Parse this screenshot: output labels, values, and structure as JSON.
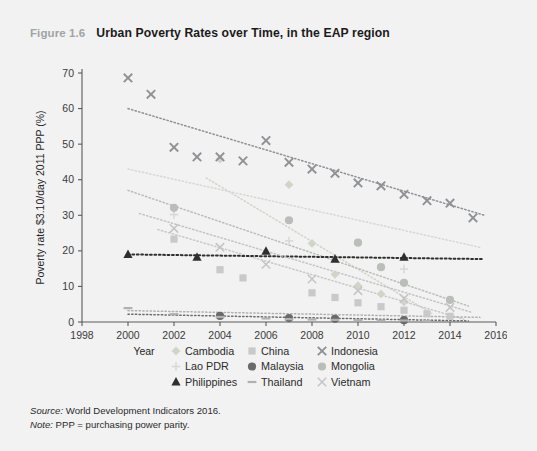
{
  "figure": {
    "number": "Figure 1.6",
    "title": "Urban Poverty Rates over Time, in the EAP region"
  },
  "notes": {
    "source_label": "Source:",
    "source_text": " World Development Indicators 2016.",
    "note_label": "Note:",
    "note_text": " PPP = purchasing power parity."
  },
  "chart_data": {
    "type": "scatter",
    "title": "Urban Poverty Rates over Time, in the EAP region",
    "xlabel": "Year",
    "ylabel": "Poverty rate $3.10/day 2011 PPP (%)",
    "xlim": [
      1998,
      2016
    ],
    "ylim": [
      0,
      70
    ],
    "xticks": [
      1998,
      2000,
      2002,
      2004,
      2006,
      2008,
      2010,
      2012,
      2014,
      2016
    ],
    "yticks": [
      0,
      10,
      20,
      30,
      40,
      50,
      60,
      70
    ],
    "grid": false,
    "legend_position": "bottom",
    "trendlines": true,
    "series": [
      {
        "name": "Cambodia",
        "marker": "diamond",
        "color": "#cfd6c8",
        "points": [
          {
            "x": 2004,
            "y": 45.8
          },
          {
            "x": 2007,
            "y": 38.6
          },
          {
            "x": 2008,
            "y": 22.1
          },
          {
            "x": 2009,
            "y": 13.4
          },
          {
            "x": 2010,
            "y": 10.2
          },
          {
            "x": 2011,
            "y": 7.9
          },
          {
            "x": 2012,
            "y": 5.6
          }
        ],
        "trend": {
          "x1": 2003.4,
          "y1": 40.5,
          "x2": 2013.2,
          "y2": 2.4
        }
      },
      {
        "name": "China",
        "marker": "square",
        "color": "#c9c9c9",
        "points": [
          {
            "x": 2002,
            "y": 23.3
          },
          {
            "x": 2004,
            "y": 14.7
          },
          {
            "x": 2005,
            "y": 12.4
          },
          {
            "x": 2008,
            "y": 8.2
          },
          {
            "x": 2009,
            "y": 6.9
          },
          {
            "x": 2010,
            "y": 5.4
          },
          {
            "x": 2011,
            "y": 4.3
          },
          {
            "x": 2012,
            "y": 3.3
          },
          {
            "x": 2013,
            "y": 2.3
          },
          {
            "x": 2014,
            "y": 1.6
          }
        ],
        "trend": {
          "x1": 2001.3,
          "y1": 26.0,
          "x2": 2014.6,
          "y2": 0.8
        }
      },
      {
        "name": "Indonesia",
        "marker": "x",
        "color": "#8f9196",
        "points": [
          {
            "x": 2000,
            "y": 68.6
          },
          {
            "x": 2001,
            "y": 64.0
          },
          {
            "x": 2002,
            "y": 49.1
          },
          {
            "x": 2003,
            "y": 46.4
          },
          {
            "x": 2004,
            "y": 46.4
          },
          {
            "x": 2005,
            "y": 45.3
          },
          {
            "x": 2006,
            "y": 51.0
          },
          {
            "x": 2007,
            "y": 44.9
          },
          {
            "x": 2008,
            "y": 43.0
          },
          {
            "x": 2009,
            "y": 41.8
          },
          {
            "x": 2010,
            "y": 39.1
          },
          {
            "x": 2011,
            "y": 38.3
          },
          {
            "x": 2012,
            "y": 35.9
          },
          {
            "x": 2013,
            "y": 34.1
          },
          {
            "x": 2014,
            "y": 33.4
          },
          {
            "x": 2015,
            "y": 29.3
          }
        ],
        "trend": {
          "x1": 2000.0,
          "y1": 60.0,
          "x2": 2015.5,
          "y2": 30.0
        }
      },
      {
        "name": "Lao PDR",
        "marker": "plus",
        "color": "#d7d7d7",
        "points": [
          {
            "x": 2002,
            "y": 30.2
          },
          {
            "x": 2007,
            "y": 22.8
          },
          {
            "x": 2012,
            "y": 14.9
          }
        ],
        "trend": {
          "x1": 2000.0,
          "y1": 43.0,
          "x2": 2015.3,
          "y2": 21.0
        }
      },
      {
        "name": "Malaysia",
        "marker": "circle",
        "color": "#6a6a6a",
        "points": [
          {
            "x": 2004,
            "y": 1.7
          },
          {
            "x": 2007,
            "y": 1.1
          },
          {
            "x": 2009,
            "y": 0.9
          },
          {
            "x": 2012,
            "y": 0.5
          }
        ],
        "trend": {
          "x1": 2000.0,
          "y1": 2.2,
          "x2": 2014.8,
          "y2": 0.3
        }
      },
      {
        "name": "Mongolia",
        "marker": "circle-light",
        "color": "#b9bfb8",
        "points": [
          {
            "x": 2002,
            "y": 32.1
          },
          {
            "x": 2007,
            "y": 28.6
          },
          {
            "x": 2010,
            "y": 22.3
          },
          {
            "x": 2011,
            "y": 15.4
          },
          {
            "x": 2012,
            "y": 11.0
          },
          {
            "x": 2014,
            "y": 6.2
          }
        ],
        "trend": {
          "x1": 2000.0,
          "y1": 37.0,
          "x2": 2014.8,
          "y2": 4.5
        }
      },
      {
        "name": "Philippines",
        "marker": "triangle",
        "color": "#2f2f2f",
        "points": [
          {
            "x": 2000,
            "y": 19.0
          },
          {
            "x": 2003,
            "y": 18.2
          },
          {
            "x": 2006,
            "y": 19.9
          },
          {
            "x": 2009,
            "y": 17.7
          },
          {
            "x": 2012,
            "y": 18.2
          }
        ],
        "trend": {
          "x1": 2000.0,
          "y1": 19.0,
          "x2": 2015.4,
          "y2": 17.7
        }
      },
      {
        "name": "Thailand",
        "marker": "line",
        "color": "#b0b0b0",
        "points": [
          {
            "x": 2000,
            "y": 3.9
          },
          {
            "x": 2002,
            "y": 2.2
          },
          {
            "x": 2004,
            "y": 1.4
          },
          {
            "x": 2006,
            "y": 1.0
          },
          {
            "x": 2007,
            "y": 0.8
          },
          {
            "x": 2008,
            "y": 0.7
          },
          {
            "x": 2009,
            "y": 0.6
          },
          {
            "x": 2010,
            "y": 0.5
          },
          {
            "x": 2011,
            "y": 0.4
          },
          {
            "x": 2012,
            "y": 0.4
          },
          {
            "x": 2013,
            "y": 0.3
          }
        ],
        "trend": {
          "x1": 2000.0,
          "y1": 3.2,
          "x2": 2015.3,
          "y2": 1.3
        }
      },
      {
        "name": "Vietnam",
        "marker": "x-light",
        "color": "#c4c4c4",
        "points": [
          {
            "x": 2002,
            "y": 26.3
          },
          {
            "x": 2004,
            "y": 21.0
          },
          {
            "x": 2006,
            "y": 16.2
          },
          {
            "x": 2008,
            "y": 12.1
          },
          {
            "x": 2010,
            "y": 8.8
          },
          {
            "x": 2012,
            "y": 6.6
          },
          {
            "x": 2014,
            "y": 4.1
          }
        ],
        "trend": {
          "x1": 2000.5,
          "y1": 30.5,
          "x2": 2014.9,
          "y2": 2.8
        }
      }
    ]
  },
  "legend": {
    "rows": [
      [
        {
          "label": "Cambodia",
          "marker": "diamond",
          "color": "#cfd6c8"
        },
        {
          "label": "China",
          "marker": "square",
          "color": "#c9c9c9"
        },
        {
          "label": "Indonesia",
          "marker": "x",
          "color": "#8f9196"
        }
      ],
      [
        {
          "label": "Lao PDR",
          "marker": "plus",
          "color": "#d7d7d7"
        },
        {
          "label": "Malaysia",
          "marker": "circle",
          "color": "#6a6a6a"
        },
        {
          "label": "Mongolia",
          "marker": "circle-light",
          "color": "#b9bfb8"
        }
      ],
      [
        {
          "label": "Philippines",
          "marker": "triangle",
          "color": "#2f2f2f"
        },
        {
          "label": "Thailand",
          "marker": "line",
          "color": "#b0b0b0"
        },
        {
          "label": "Vietnam",
          "marker": "x-light",
          "color": "#c4c4c4"
        }
      ]
    ]
  }
}
